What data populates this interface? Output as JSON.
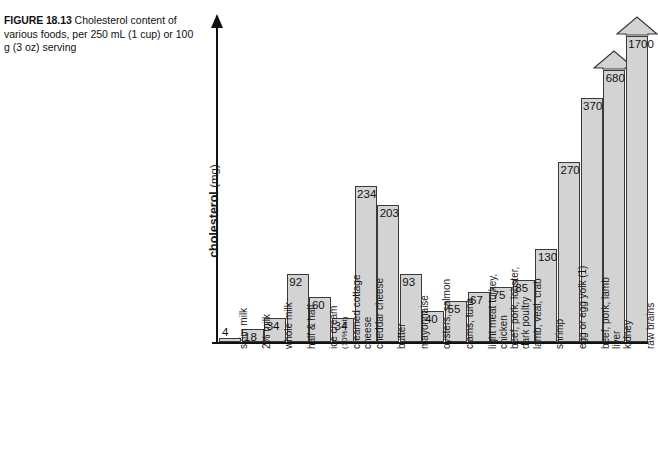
{
  "caption": {
    "figure_label": "FIGURE 18.13",
    "text": "Cholesterol content of various foods, per 250 mL (1 cup) or 100 g (3 oz) serving"
  },
  "axis": {
    "y_label_bold": "cholesterol",
    "y_label_unit": "(mg)"
  },
  "chart_data": {
    "type": "bar",
    "title": "Cholesterol content of various foods, per 250 mL (1 cup) or 100 g (3 oz) serving",
    "xlabel": "",
    "ylabel": "cholesterol (mg)",
    "ylim": [
      0,
      600
    ],
    "grid": false,
    "legend": "none",
    "note": "The last two bars are drawn as broken-scale arrows because their values exceed the plotted axis range.",
    "categories": [
      "skim milk",
      "2% milk",
      "whole milk",
      "half & half",
      "ice cream (10% fat)",
      "creamed cottage cheese",
      "cheddar cheese",
      "butter",
      "mayonnaise",
      "oysters, salmon",
      "clams, tuna",
      "light meat turkey, chicken",
      "beef, pork, lobster, dark poultry",
      "lamb, veal, crab",
      "shrimp",
      "egg or egg yolk (1)",
      "beef, pork, lamb liver",
      "kidney",
      "raw brains"
    ],
    "values": [
      4,
      18,
      34,
      92,
      60,
      34,
      234,
      203,
      93,
      40,
      55,
      67,
      75,
      85,
      130,
      270,
      370,
      680,
      1700
    ],
    "value_labels": [
      "4",
      "18",
      "34",
      "92",
      "60",
      "34",
      "234",
      "203",
      "93",
      "40",
      "55",
      "67",
      "75",
      "85",
      "130",
      "270",
      "370",
      "680",
      "1700"
    ],
    "broken_scale_bars": [
      17,
      18
    ]
  },
  "bars": [
    {
      "label_line1": "skim milk",
      "label_line2": "",
      "value": "4",
      "h": 4,
      "label_outside": true,
      "arrow": false
    },
    {
      "label_line1": "2% milk",
      "label_line2": "",
      "value": "18",
      "h": 13,
      "label_outside": false,
      "arrow": false
    },
    {
      "label_line1": "whole milk",
      "label_line2": "",
      "value": "34",
      "h": 24,
      "label_outside": false,
      "arrow": false
    },
    {
      "label_line1": "half & half",
      "label_line2": "",
      "value": "92",
      "h": 68,
      "label_outside": false,
      "arrow": false
    },
    {
      "label_line1": "ice cream",
      "label_line2": "(10% fat)",
      "value": "60",
      "h": 45,
      "label_outside": false,
      "arrow": false
    },
    {
      "label_line1": "creamed cottage",
      "label_line2": "cheese",
      "value": "34",
      "h": 24,
      "label_outside": false,
      "arrow": false
    },
    {
      "label_line1": "cheddar cheese",
      "label_line2": "",
      "value": "234",
      "h": 156,
      "label_outside": false,
      "arrow": false
    },
    {
      "label_line1": "butter",
      "label_line2": "",
      "value": "203",
      "h": 137,
      "label_outside": false,
      "arrow": false
    },
    {
      "label_line1": "mayonnaise",
      "label_line2": "",
      "value": "93",
      "h": 68,
      "label_outside": false,
      "arrow": false
    },
    {
      "label_line1": "oysters, salmon",
      "label_line2": "",
      "value": "40",
      "h": 31,
      "label_outside": false,
      "arrow": false
    },
    {
      "label_line1": "clams, tuna",
      "label_line2": "",
      "value": "55",
      "h": 41,
      "label_outside": false,
      "arrow": false
    },
    {
      "label_line1": "light meat turkey,",
      "label_line2": "chicken",
      "value": "67",
      "h": 50,
      "label_outside": false,
      "arrow": false
    },
    {
      "label_line1": "beef, pork, lobster,",
      "label_line2": "dark poultry",
      "value": "75",
      "h": 55,
      "label_outside": false,
      "arrow": false
    },
    {
      "label_line1": "lamb, veal, crab",
      "label_line2": "",
      "value": "85",
      "h": 62,
      "label_outside": false,
      "arrow": false
    },
    {
      "label_line1": "shrimp",
      "label_line2": "",
      "value": "130",
      "h": 93,
      "label_outside": false,
      "arrow": false
    },
    {
      "label_line1": "egg or egg yolk (1)",
      "label_line2": "",
      "value": "270",
      "h": 180,
      "label_outside": false,
      "arrow": false
    },
    {
      "label_line1": "beef, pork, lamb",
      "label_line2": "liver",
      "value": "370",
      "h": 244,
      "label_outside": false,
      "arrow": false
    },
    {
      "label_line1": "kidney",
      "label_line2": "",
      "value": "680",
      "h": 272,
      "label_outside": false,
      "arrow": true
    },
    {
      "label_line1": "raw brains",
      "label_line2": "",
      "value": "1700",
      "h": 306,
      "label_outside": false,
      "arrow": true
    }
  ]
}
